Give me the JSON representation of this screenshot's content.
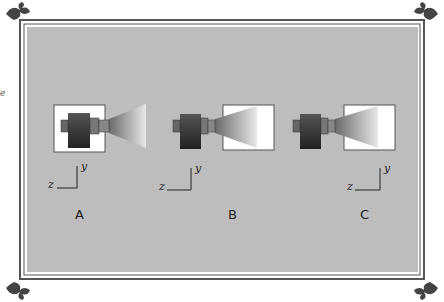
{
  "figure": {
    "panels": [
      {
        "id": "A",
        "label": "A",
        "axis_x": "z",
        "axis_y": "y",
        "layout": "camera inside white box, frustum extends outside"
      },
      {
        "id": "B",
        "label": "B",
        "axis_x": "z",
        "axis_y": "y",
        "layout": "camera outside, frustum ends inside white box"
      },
      {
        "id": "C",
        "label": "C",
        "axis_x": "z",
        "axis_y": "y",
        "layout": "camera outside, frustum ends inside white box, axes right"
      }
    ],
    "stray_glyph": "e",
    "colors": {
      "panel_bg": "#bdbdbd",
      "frame": "#555555",
      "box": "#ffffff",
      "camera_dark": "#2a2a2a",
      "camera_light": "#7a7a7a"
    }
  }
}
